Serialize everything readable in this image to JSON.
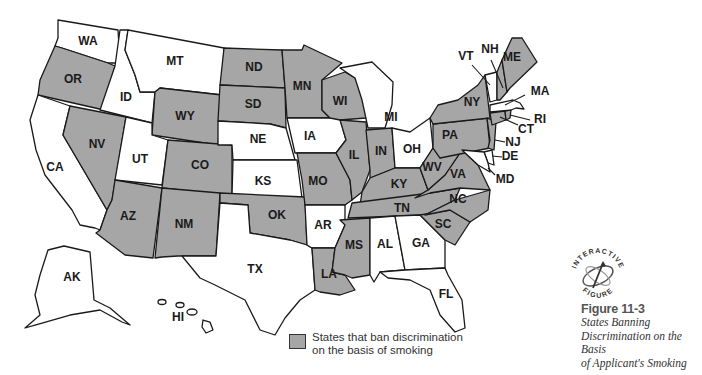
{
  "figure": {
    "number": "Figure 11-3",
    "title_lines": [
      "States Banning",
      "Discrimination on the Basis",
      "of Applicant's Smoking"
    ]
  },
  "badge": {
    "top_text": "INTERACTIVE",
    "bottom_text": "FIGURE"
  },
  "legend": {
    "swatch_color": "#a6a6a6",
    "line1": "States that ban discrimination",
    "line2": "on the basis of smoking"
  },
  "colors": {
    "banned": "#a6a6a6",
    "not_banned": "#ffffff",
    "stroke": "#1a1a1a"
  },
  "states": {
    "WA": {
      "label": "WA",
      "banned": false
    },
    "OR": {
      "label": "OR",
      "banned": true
    },
    "CA": {
      "label": "CA",
      "banned": false
    },
    "ID": {
      "label": "ID",
      "banned": false
    },
    "NV": {
      "label": "NV",
      "banned": true
    },
    "MT": {
      "label": "MT",
      "banned": false
    },
    "WY": {
      "label": "WY",
      "banned": true
    },
    "UT": {
      "label": "UT",
      "banned": false
    },
    "CO": {
      "label": "CO",
      "banned": true
    },
    "AZ": {
      "label": "AZ",
      "banned": true
    },
    "NM": {
      "label": "NM",
      "banned": true
    },
    "ND": {
      "label": "ND",
      "banned": true
    },
    "SD": {
      "label": "SD",
      "banned": true
    },
    "NE": {
      "label": "NE",
      "banned": false
    },
    "KS": {
      "label": "KS",
      "banned": false
    },
    "OK": {
      "label": "OK",
      "banned": true
    },
    "TX": {
      "label": "TX",
      "banned": false
    },
    "MN": {
      "label": "MN",
      "banned": true
    },
    "IA": {
      "label": "IA",
      "banned": false
    },
    "MO": {
      "label": "MO",
      "banned": true
    },
    "AR": {
      "label": "AR",
      "banned": false
    },
    "LA": {
      "label": "LA",
      "banned": true
    },
    "WI": {
      "label": "WI",
      "banned": true
    },
    "IL": {
      "label": "IL",
      "banned": true
    },
    "MI": {
      "label": "MI",
      "banned": false
    },
    "IN": {
      "label": "IN",
      "banned": true
    },
    "OH": {
      "label": "OH",
      "banned": false
    },
    "KY": {
      "label": "KY",
      "banned": true
    },
    "TN": {
      "label": "TN",
      "banned": true
    },
    "MS": {
      "label": "MS",
      "banned": true
    },
    "AL": {
      "label": "AL",
      "banned": false
    },
    "GA": {
      "label": "GA",
      "banned": false
    },
    "FL": {
      "label": "FL",
      "banned": false
    },
    "SC": {
      "label": "SC",
      "banned": true
    },
    "NC": {
      "label": "NC",
      "banned": true
    },
    "VA": {
      "label": "VA",
      "banned": true
    },
    "WV": {
      "label": "WV",
      "banned": true
    },
    "PA": {
      "label": "PA",
      "banned": true
    },
    "NY": {
      "label": "NY",
      "banned": true
    },
    "NJ": {
      "label": "NJ",
      "banned": true
    },
    "DE": {
      "label": "DE",
      "banned": false
    },
    "MD": {
      "label": "MD",
      "banned": false
    },
    "CT": {
      "label": "CT",
      "banned": true
    },
    "RI": {
      "label": "RI",
      "banned": true
    },
    "MA": {
      "label": "MA",
      "banned": false
    },
    "VT": {
      "label": "VT",
      "banned": false
    },
    "NH": {
      "label": "NH",
      "banned": true
    },
    "ME": {
      "label": "ME",
      "banned": true
    },
    "AK": {
      "label": "AK",
      "banned": false
    },
    "HI": {
      "label": "HI",
      "banned": false
    }
  }
}
